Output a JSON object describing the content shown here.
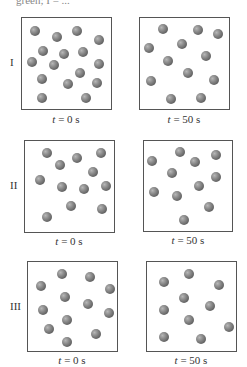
{
  "header": {
    "text": "green; I = ..."
  },
  "ball_color": "#7a7a7a",
  "rows": [
    {
      "label": "I",
      "panels": [
        {
          "caption_var": "t",
          "caption_rest": " = 0 s",
          "box": [
            21,
            17,
            91,
            93
          ],
          "balls": [
            [
              35,
              31
            ],
            [
              57,
              37
            ],
            [
              77,
              31
            ],
            [
              99,
              40
            ],
            [
              43,
              51
            ],
            [
              64,
              54
            ],
            [
              83,
              52
            ],
            [
              32,
              62
            ],
            [
              54,
              65
            ],
            [
              99,
              64
            ],
            [
              80,
              73
            ],
            [
              42,
              79
            ],
            [
              68,
              84
            ],
            [
              97,
              83
            ],
            [
              42,
              98
            ],
            [
              86,
              98
            ]
          ]
        },
        {
          "caption_var": "t",
          "caption_rest": " = 50 s",
          "box": [
            139,
            17,
            91,
            93
          ],
          "balls": [
            [
              163,
              29
            ],
            [
              198,
              30
            ],
            [
              218,
              34
            ],
            [
              149,
              48
            ],
            [
              182,
              44
            ],
            [
              206,
              56
            ],
            [
              168,
              61
            ],
            [
              188,
              73
            ],
            [
              151,
              81
            ],
            [
              214,
              80
            ],
            [
              171,
              99
            ],
            [
              201,
              98
            ]
          ]
        }
      ]
    },
    {
      "label": "II",
      "panels": [
        {
          "caption_var": "t",
          "caption_rest": " = 0 s",
          "box": [
            24,
            140,
            91,
            93
          ],
          "balls": [
            [
              47,
              153
            ],
            [
              77,
              158
            ],
            [
              101,
              153
            ],
            [
              60,
              165
            ],
            [
              93,
              172
            ],
            [
              40,
              180
            ],
            [
              62,
              187
            ],
            [
              84,
              189
            ],
            [
              106,
              186
            ],
            [
              71,
              206
            ],
            [
              102,
              209
            ],
            [
              47,
              217
            ]
          ]
        },
        {
          "caption_var": "t",
          "caption_rest": " = 50 s",
          "box": [
            143,
            140,
            90,
            92
          ],
          "balls": [
            [
              180,
              152
            ],
            [
              216,
              155
            ],
            [
              152,
              161
            ],
            [
              195,
              162
            ],
            [
              172,
              173
            ],
            [
              216,
              177
            ],
            [
              199,
              186
            ],
            [
              154,
              192
            ],
            [
              177,
              196
            ],
            [
              209,
              207
            ],
            [
              184,
              220
            ]
          ]
        }
      ]
    },
    {
      "label": "III",
      "panels": [
        {
          "caption_var": "t",
          "caption_rest": " = 0 s",
          "box": [
            27,
            261,
            91,
            91
          ],
          "balls": [
            [
              62,
              274
            ],
            [
              90,
              277
            ],
            [
              41,
              286
            ],
            [
              110,
              289
            ],
            [
              65,
              297
            ],
            [
              88,
              304
            ],
            [
              43,
              310
            ],
            [
              109,
              313
            ],
            [
              67,
              320
            ],
            [
              49,
              329
            ],
            [
              96,
              334
            ],
            [
              67,
              342
            ]
          ]
        },
        {
          "caption_var": "t",
          "caption_rest": " = 50 s",
          "box": [
            146,
            261,
            91,
            91
          ],
          "balls": [
            [
              189,
              274
            ],
            [
              164,
              282
            ],
            [
              219,
              285
            ],
            [
              184,
              298
            ],
            [
              210,
              306
            ],
            [
              164,
              310
            ],
            [
              189,
              320
            ],
            [
              229,
              327
            ],
            [
              164,
              337
            ],
            [
              201,
              339
            ]
          ]
        }
      ]
    }
  ]
}
